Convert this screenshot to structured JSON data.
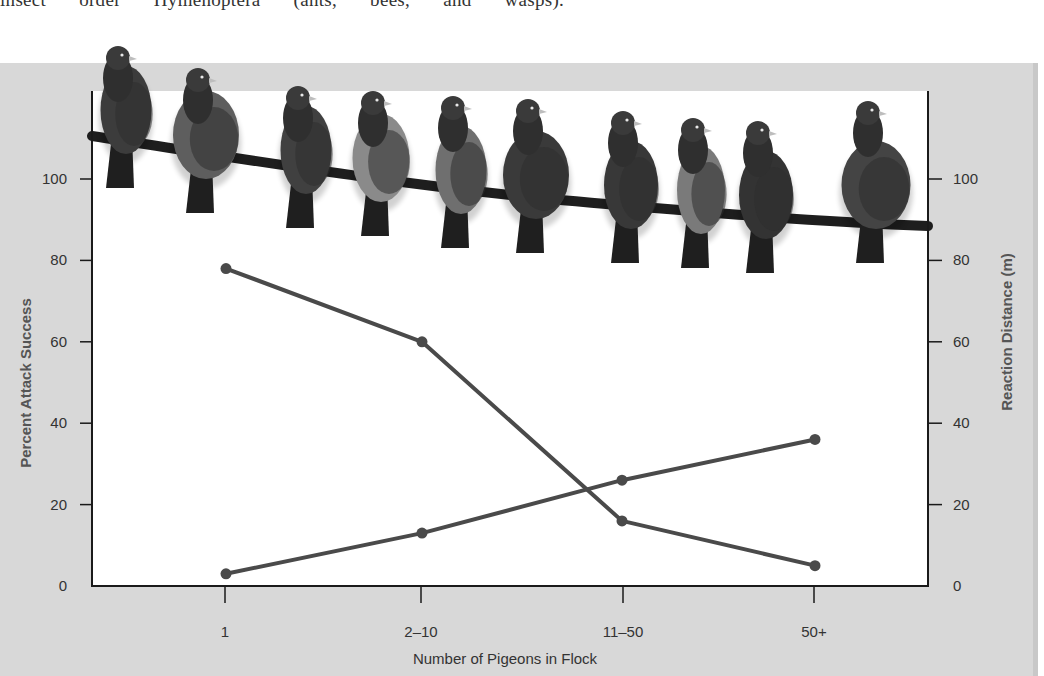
{
  "page": {
    "top_text": "insect order Hymenoptera (ants, bees, and wasps)."
  },
  "colors": {
    "panel_bg": "#d8d8d8",
    "plot_bg": "#ffffff",
    "line": "#4a4a4a",
    "axis": "#1a1a1a"
  },
  "illustration": {
    "name": "pigeons-on-branch",
    "description": "Row of ten pigeons perched on a branch across the top of the plot"
  },
  "chart_data": {
    "type": "line",
    "title": "",
    "categories": [
      "1",
      "2–10",
      "11–50",
      "50+"
    ],
    "xlabel": "Number of Pigeons in Flock",
    "ylabel": "Percent Attack Success",
    "ylabel_right": "Reaction Distance (m)",
    "ylim": [
      0,
      100
    ],
    "ylim_right": [
      0,
      100
    ],
    "yticks": [
      0,
      20,
      40,
      60,
      80,
      100
    ],
    "yticks_right": [
      0,
      20,
      40,
      60,
      80,
      100
    ],
    "grid": false,
    "legend": null,
    "series": [
      {
        "name": "Percent Attack Success",
        "axis": "left",
        "values": [
          78,
          60,
          16,
          5
        ]
      },
      {
        "name": "Reaction Distance (m)",
        "axis": "right",
        "values": [
          3,
          13,
          26,
          36
        ]
      }
    ]
  }
}
